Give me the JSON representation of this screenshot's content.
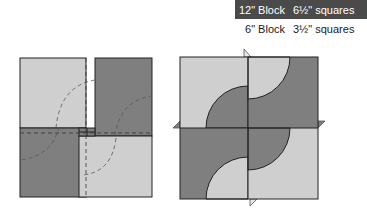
{
  "size_table": {
    "rows": [
      {
        "block": "12\" Block",
        "squares": "6½\" squares",
        "style": "dark"
      },
      {
        "block": "6\" Block",
        "squares": "3½\" squares",
        "style": "light"
      }
    ]
  },
  "colors": {
    "light_fabric": "#cfcfcf",
    "dark_fabric": "#7f7f7f",
    "outline": "#222222",
    "header_dark": "#4a4a4a"
  },
  "diagrams": {
    "left": {
      "label": "overlapping squares with dashed cutting lines"
    },
    "right": {
      "label": "folded quarter-circle block with flaps"
    }
  }
}
